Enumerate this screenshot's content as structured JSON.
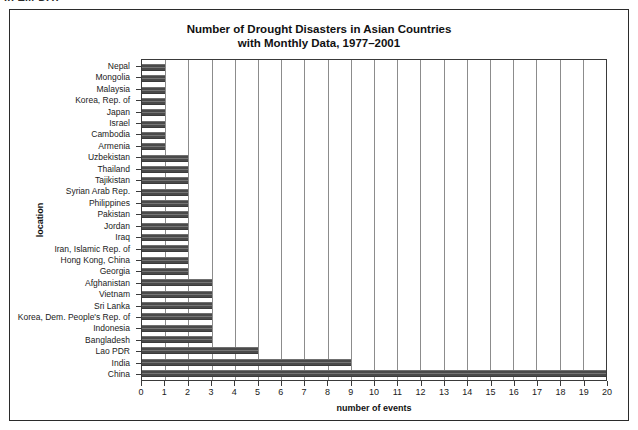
{
  "caption_fragment": "in EM-DAT",
  "chart_data": {
    "type": "bar",
    "orientation": "horizontal",
    "title": "Number of Drought Disasters in Asian Countries with Monthly Data, 1977–2001",
    "title_line1": "Number of Drought Disasters in Asian Countries",
    "title_line2": "with Monthly Data, 1977–2001",
    "xlabel": "number of events",
    "ylabel": "location",
    "xlim": [
      0,
      20
    ],
    "xticks": [
      0,
      1,
      2,
      3,
      4,
      5,
      6,
      7,
      8,
      9,
      10,
      11,
      12,
      13,
      14,
      15,
      16,
      17,
      18,
      19,
      20
    ],
    "grid": "vertical",
    "legend": "none",
    "bar_color": "#4a4a4a",
    "categories": [
      "Nepal",
      "Mongolia",
      "Malaysia",
      "Korea, Rep. of",
      "Japan",
      "Israel",
      "Cambodia",
      "Armenia",
      "Uzbekistan",
      "Thailand",
      "Tajikistan",
      "Syrian Arab Rep.",
      "Philippines",
      "Pakistan",
      "Jordan",
      "Iraq",
      "Iran, Islamic Rep. of",
      "Hong Kong, China",
      "Georgia",
      "Afghanistan",
      "Vietnam",
      "Sri Lanka",
      "Korea, Dem. People's Rep. of",
      "Indonesia",
      "Bangladesh",
      "Lao PDR",
      "India",
      "China"
    ],
    "values": [
      1,
      1,
      1,
      1,
      1,
      1,
      1,
      1,
      2,
      2,
      2,
      2,
      2,
      2,
      2,
      2,
      2,
      2,
      2,
      3,
      3,
      3,
      3,
      3,
      3,
      5,
      9,
      20
    ]
  }
}
